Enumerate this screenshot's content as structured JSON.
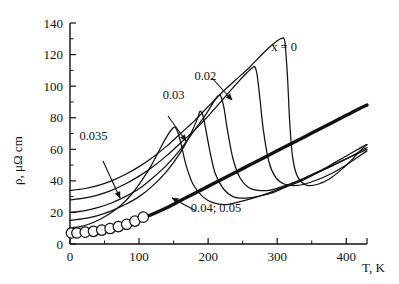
{
  "chart_data": {
    "type": "line",
    "title": "",
    "xlabel": "T, K",
    "ylabel": "ρ, μΩ cm",
    "xlim": [
      0,
      430
    ],
    "ylim": [
      0,
      140
    ],
    "grid": false,
    "legend_position": "inline-annotations",
    "xticks": [
      0,
      100,
      200,
      300,
      400
    ],
    "xtick_labels": [
      "0",
      "100",
      "200",
      "300",
      "400"
    ],
    "xminor_ticks": [
      50,
      150,
      250,
      350
    ],
    "yticks": [
      0,
      20,
      40,
      60,
      80,
      100,
      120,
      140
    ],
    "ytick_labels": [
      "0",
      "20",
      "40",
      "60",
      "80",
      "100",
      "120",
      "140"
    ],
    "yminor_ticks": [
      10,
      30,
      50,
      70,
      90,
      110,
      130
    ],
    "series": [
      {
        "name": "x = 0",
        "label": "x = 0",
        "style": "thin",
        "markers": false,
        "peak_x": 310,
        "peak_y": 130,
        "x": [
          0,
          20,
          40,
          60,
          80,
          100,
          120,
          140,
          160,
          180,
          200,
          220,
          240,
          260,
          280,
          295,
          305,
          310,
          312,
          315,
          318,
          322,
          328,
          336,
          345,
          360,
          375,
          390,
          405,
          420,
          430
        ],
        "y": [
          34,
          35,
          37,
          40,
          44,
          49,
          55,
          62,
          70,
          78,
          87,
          96,
          104,
          112,
          121,
          127,
          130,
          130,
          124,
          105,
          78,
          56,
          44,
          39,
          37,
          38,
          41,
          46,
          52,
          59,
          63
        ]
      },
      {
        "name": "0.02",
        "label": "0.02",
        "style": "thin",
        "markers": false,
        "peak_x": 268,
        "peak_y": 112,
        "x": [
          0,
          20,
          40,
          60,
          80,
          100,
          120,
          140,
          160,
          180,
          200,
          220,
          240,
          255,
          265,
          268,
          271,
          275,
          280,
          288,
          298,
          310,
          325,
          340,
          360,
          380,
          400,
          420,
          430
        ],
        "y": [
          28,
          29,
          31,
          34,
          38,
          43,
          49,
          56,
          64,
          72,
          81,
          91,
          101,
          108,
          112,
          112,
          107,
          92,
          72,
          52,
          42,
          38,
          37,
          38,
          41,
          45,
          50,
          56,
          59
        ]
      },
      {
        "name": "0.03",
        "label": "0.03",
        "style": "thin",
        "markers": false,
        "peak_x": 215,
        "peak_y": 94,
        "x": [
          0,
          20,
          40,
          60,
          80,
          100,
          120,
          140,
          160,
          180,
          195,
          208,
          215,
          219,
          223,
          228,
          236,
          246,
          258,
          272,
          288,
          305,
          325,
          345,
          365,
          385,
          405,
          425,
          430
        ],
        "y": [
          20,
          21,
          23,
          26,
          30,
          35,
          42,
          50,
          60,
          72,
          81,
          90,
          94,
          93,
          86,
          72,
          54,
          42,
          36,
          34,
          34,
          36,
          39,
          43,
          47,
          52,
          57,
          62,
          63
        ]
      },
      {
        "name": "0.03b",
        "label": "",
        "style": "thin",
        "markers": false,
        "peak_x": 188,
        "peak_y": 84,
        "x": [
          0,
          20,
          40,
          60,
          80,
          100,
          120,
          140,
          160,
          175,
          185,
          188,
          192,
          196,
          202,
          210,
          222,
          236,
          252,
          270,
          290,
          312,
          335,
          358,
          382,
          405,
          425,
          430
        ],
        "y": [
          15,
          16,
          18,
          21,
          25,
          30,
          37,
          46,
          58,
          70,
          80,
          84,
          82,
          74,
          60,
          45,
          35,
          30,
          29,
          30,
          32,
          36,
          40,
          45,
          50,
          55,
          60,
          61
        ]
      },
      {
        "name": "0.035",
        "label": "0.035",
        "style": "thin",
        "markers": false,
        "peak_x": 150,
        "peak_y": 74,
        "x": [
          0,
          15,
          30,
          45,
          60,
          75,
          90,
          105,
          118,
          130,
          140,
          148,
          152,
          156,
          161,
          168,
          178,
          192,
          208,
          226,
          248,
          272,
          298,
          325,
          352,
          380,
          405,
          425,
          430
        ],
        "y": [
          10,
          11,
          13,
          16,
          20,
          25,
          32,
          41,
          50,
          60,
          68,
          73,
          74,
          71,
          63,
          50,
          38,
          30,
          26,
          25,
          27,
          30,
          34,
          39,
          44,
          50,
          55,
          59,
          60
        ]
      },
      {
        "name": "0.04; 0.05",
        "label": "0.04; 0.05",
        "style": "thick",
        "markers": true,
        "marker_x": [
          2,
          10,
          22,
          34,
          46,
          58,
          70,
          82,
          94,
          106
        ],
        "marker_y": [
          7,
          7,
          7.5,
          8,
          8.8,
          9.8,
          11,
          12.5,
          14.5,
          17
        ],
        "x": [
          0,
          20,
          40,
          60,
          80,
          100,
          120,
          140,
          160,
          180,
          200,
          220,
          240,
          260,
          280,
          300,
          320,
          340,
          360,
          380,
          400,
          420,
          430
        ],
        "y": [
          7,
          7.4,
          8.4,
          10,
          12.3,
          15.4,
          19,
          23,
          27.5,
          32,
          36.5,
          41,
          45.5,
          50,
          54.5,
          59,
          63.5,
          68,
          72.5,
          77,
          81.5,
          86,
          88
        ]
      }
    ],
    "annotations": [
      {
        "name": "label-x0",
        "text": "x = 0",
        "x": 310,
        "y": 122,
        "leader": false
      },
      {
        "name": "label-002",
        "text": "0.02",
        "x": 196,
        "y": 104,
        "leader": true
      },
      {
        "name": "label-003",
        "text": "0.03",
        "x": 150,
        "y": 92,
        "leader": true
      },
      {
        "name": "label-0035",
        "text": "0.035",
        "x": 34,
        "y": 66,
        "leader": true
      },
      {
        "name": "label-004-005",
        "text": "0.04; 0.05",
        "x": 175,
        "y": 20,
        "leader": true
      }
    ]
  }
}
